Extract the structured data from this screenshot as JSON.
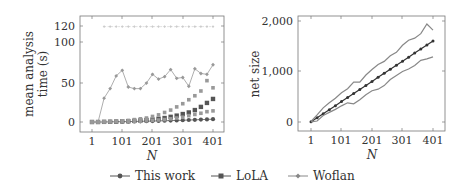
{
  "chart_data": [
    {
      "type": "line",
      "title": "",
      "xlabel": "N",
      "ylabel": "mean analysis time (s)",
      "ylabel_lines": [
        "mean analysis",
        "time (s)"
      ],
      "x_ticks": [
        "1",
        "101",
        "201",
        "301",
        "401"
      ],
      "y_ticks": [
        "0",
        "50",
        "100",
        "120"
      ],
      "ylim": [
        -5,
        125
      ],
      "xlim": [
        -20,
        426
      ],
      "grid": false,
      "x": [
        1,
        21,
        41,
        61,
        81,
        101,
        121,
        141,
        161,
        181,
        201,
        221,
        241,
        261,
        281,
        301,
        321,
        341,
        361,
        381,
        401
      ],
      "series": [
        {
          "name": "This work",
          "marker": "circle",
          "color": "#555555",
          "values": [
            0,
            0,
            0,
            0.2,
            0.3,
            0.4,
            0.5,
            0.7,
            0.9,
            1.0,
            1.2,
            1.4,
            1.6,
            1.8,
            2.0,
            2.2,
            2.5,
            2.7,
            3.0,
            3.3,
            3.5
          ]
        },
        {
          "name": "LoLA",
          "marker": "square",
          "color": "#555555",
          "values": [
            0,
            0,
            0.2,
            0.3,
            0.5,
            0.8,
            1.0,
            1.5,
            2.0,
            2.5,
            3.0,
            4.0,
            5.0,
            6.5,
            8.0,
            10,
            12,
            15,
            19,
            24,
            29
          ]
        },
        {
          "name": "LoLA (upper band)",
          "marker": "square",
          "color": "#999999",
          "values": [
            0,
            0,
            0.3,
            0.5,
            1.0,
            1.5,
            2.0,
            3.0,
            4.0,
            5.0,
            7.0,
            9.0,
            12,
            15,
            19,
            23,
            28,
            33,
            39,
            52,
            43
          ]
        },
        {
          "name": "LoLA (lower band)",
          "marker": "square",
          "color": "#999999",
          "values": [
            0,
            0,
            0.1,
            0.2,
            0.3,
            0.4,
            0.5,
            0.8,
            1.0,
            1.5,
            2.0,
            2.5,
            3.0,
            4.0,
            5.0,
            6.0,
            8.0,
            9.5,
            11,
            13,
            14
          ]
        },
        {
          "name": "Woflan",
          "marker": "diamond",
          "color": "#999999",
          "values": [
            0,
            0,
            30,
            42,
            58,
            65,
            44,
            42,
            42,
            49,
            60,
            54,
            57,
            66,
            55,
            56,
            45,
            67,
            61,
            60,
            72
          ]
        },
        {
          "name": "Woflan (timeout)",
          "marker": "diamond",
          "color": "#cccccc",
          "dashed": true,
          "values": [
            null,
            null,
            120,
            120,
            120,
            120,
            120,
            120,
            120,
            120,
            120,
            120,
            120,
            120,
            120,
            120,
            120,
            120,
            120,
            120,
            120
          ]
        }
      ]
    },
    {
      "type": "line",
      "title": "",
      "xlabel": "N",
      "ylabel": "net size",
      "x_ticks": [
        "1",
        "101",
        "201",
        "301",
        "401"
      ],
      "y_ticks": [
        "0",
        "1,000",
        "2,000"
      ],
      "ylim": [
        -170,
        2100
      ],
      "xlim": [
        -40,
        446
      ],
      "grid": false,
      "x": [
        1,
        21,
        41,
        61,
        81,
        101,
        121,
        141,
        161,
        181,
        201,
        221,
        241,
        261,
        281,
        301,
        321,
        341,
        361,
        381,
        401
      ],
      "series": [
        {
          "name": "net size (mean)",
          "marker": "circle",
          "color": "#333333",
          "values": [
            4,
            84,
            164,
            244,
            324,
            404,
            484,
            564,
            644,
            724,
            804,
            884,
            964,
            1044,
            1124,
            1204,
            1284,
            1364,
            1444,
            1524,
            1604
          ]
        },
        {
          "name": "net size (max)",
          "marker": "none",
          "color": "#888888",
          "values": [
            10,
            140,
            280,
            380,
            470,
            580,
            660,
            790,
            790,
            930,
            1040,
            1140,
            1200,
            1310,
            1380,
            1520,
            1620,
            1660,
            1750,
            1940,
            1820
          ]
        },
        {
          "name": "net size (min)",
          "marker": "none",
          "color": "#888888",
          "values": [
            2,
            20,
            130,
            190,
            250,
            320,
            380,
            360,
            440,
            540,
            620,
            650,
            720,
            840,
            920,
            1000,
            1050,
            1120,
            1220,
            1250,
            1290
          ]
        }
      ]
    }
  ],
  "legend": {
    "items": [
      {
        "label": "This work",
        "marker": "circle"
      },
      {
        "label": "LoLA",
        "marker": "square"
      },
      {
        "label": "Woflan",
        "marker": "diamond"
      }
    ]
  },
  "left": {
    "ylabel_line1": "mean analysis",
    "ylabel_line2": "time (s)",
    "xlabel": "N",
    "yticks": [
      "120",
      "100",
      "50",
      "0"
    ],
    "xticks": [
      "1",
      "101",
      "201",
      "301",
      "401"
    ]
  },
  "right": {
    "ylabel": "net size",
    "xlabel": "N",
    "yticks": [
      "2,000",
      "1,000",
      "0"
    ],
    "xticks": [
      "1",
      "101",
      "201",
      "301",
      "401"
    ]
  }
}
